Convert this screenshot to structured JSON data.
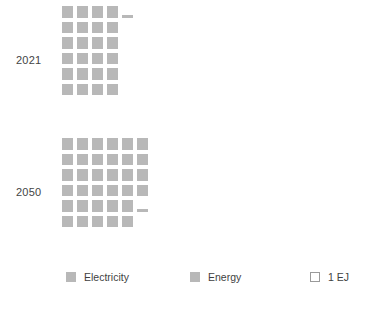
{
  "chart_data": {
    "type": "bar",
    "title": "",
    "subtitle": "",
    "xlabel": "",
    "ylabel": "",
    "unit": "EJ",
    "unit_label": "1 EJ",
    "categories": [
      "2021",
      "2050"
    ],
    "series": [
      {
        "name": "Electricity",
        "values": [
          24.2,
          34.2
        ]
      }
    ],
    "values": [
      24.2,
      34.2
    ],
    "cell_value": 1,
    "grid": false,
    "legend_position": "bottom"
  },
  "rows": [
    {
      "label": "2021",
      "total_full_cells": 24,
      "partial_fraction": 0.25,
      "columns": 4,
      "grid": [
        [
          "full",
          "full",
          "full",
          "full",
          "partial",
          "empty"
        ],
        [
          "full",
          "full",
          "full",
          "full",
          "empty",
          "empty"
        ],
        [
          "full",
          "full",
          "full",
          "full",
          "empty",
          "empty"
        ],
        [
          "full",
          "full",
          "full",
          "full",
          "empty",
          "empty"
        ],
        [
          "full",
          "full",
          "full",
          "full",
          "empty",
          "empty"
        ],
        [
          "full",
          "full",
          "full",
          "full",
          "empty",
          "empty"
        ]
      ]
    },
    {
      "label": "2050",
      "total_full_cells": 34,
      "partial_fraction": 0.25,
      "columns": 6,
      "grid": [
        [
          "full",
          "full",
          "full",
          "full",
          "full",
          "full"
        ],
        [
          "full",
          "full",
          "full",
          "full",
          "full",
          "full"
        ],
        [
          "full",
          "full",
          "full",
          "full",
          "full",
          "full"
        ],
        [
          "full",
          "full",
          "full",
          "full",
          "full",
          "full"
        ],
        [
          "full",
          "full",
          "full",
          "full",
          "full",
          "partial"
        ],
        [
          "full",
          "full",
          "full",
          "full",
          "full",
          "empty"
        ]
      ]
    }
  ],
  "legend": {
    "items": [
      {
        "label": "Electricity",
        "style": "solid",
        "color": "#b8b8b8"
      },
      {
        "label": "Energy",
        "style": "solid",
        "color": "#b8b8b8"
      },
      {
        "label": "1 EJ",
        "style": "hollow",
        "color": "#ffffff"
      }
    ]
  },
  "colors": {
    "cell": "#b8b8b8",
    "outline": "#9a9a9a",
    "text": "#444444",
    "background": "#ffffff"
  }
}
